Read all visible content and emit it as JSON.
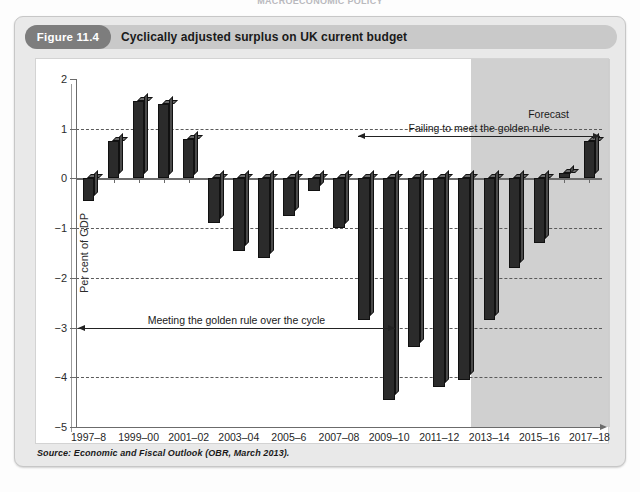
{
  "page": {
    "top_cut_text": "MACROECONOMIC POLICY"
  },
  "figure": {
    "number_label": "Figure 11.4",
    "title": "Cyclically adjusted surplus on UK current budget",
    "source": "Source: Economic and Fiscal Outlook (OBR, March 2013)."
  },
  "annotations": {
    "forecast_label": "Forecast",
    "failing_label": "Failing to meet the golden rule",
    "meeting_label": "Meeting the golden rule over the cycle"
  },
  "chart_data": {
    "type": "bar",
    "title": "Cyclically adjusted surplus on UK current budget",
    "xlabel": "",
    "ylabel": "Per cent of GDP",
    "ylim": [
      -5,
      2
    ],
    "ytick_values": [
      2,
      1,
      0,
      -1,
      -2,
      -3,
      -4,
      -5
    ],
    "ytick_labels": [
      "2",
      "1",
      "0",
      "−1",
      "−2",
      "−3",
      "−4",
      "−5"
    ],
    "grid": "horizontal-dashed",
    "legend": "none",
    "categories": [
      "1997–8",
      "1998–9",
      "1999–00",
      "2000–01",
      "2001–02",
      "2002–03",
      "2003–04",
      "2004–05",
      "2005–6",
      "2006–7",
      "2007–08",
      "2008–9",
      "2009–10",
      "2010–11",
      "2011–12",
      "2012–13",
      "2013–14",
      "2014–15",
      "2015–16",
      "2016–17",
      "2017–18"
    ],
    "xtick_labels": [
      "1997–8",
      "1999–00",
      "2001–02",
      "2003–04",
      "2005–6",
      "2007–08",
      "2009–10",
      "2011–12",
      "2013–14",
      "2015–16",
      "2017–18"
    ],
    "values": [
      -0.45,
      0.75,
      1.55,
      1.5,
      0.8,
      -0.9,
      -1.45,
      -1.6,
      -0.75,
      -0.25,
      -1.0,
      -2.85,
      -4.45,
      -3.4,
      -4.2,
      -4.05,
      -2.85,
      -1.8,
      -1.3,
      0.1,
      0.75
    ],
    "forecast_from_category": "2013–14",
    "forecast_shaded": true,
    "bar_color": "#2b2b2b"
  }
}
